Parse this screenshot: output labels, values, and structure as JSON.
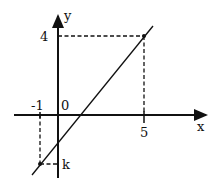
{
  "diagram": {
    "type": "coordinate-graph",
    "axes": {
      "x_label": "x",
      "y_label": "y",
      "origin_label": "0"
    },
    "ticks": {
      "x_neg": "-1",
      "x_pos": "5",
      "y_top": "4",
      "y_bottom": "k"
    },
    "points": [
      {
        "name": "A",
        "x": 5,
        "y": 4
      },
      {
        "name": "B",
        "x": -1,
        "y": "k"
      }
    ],
    "line": {
      "description": "straight line through (-1, k) and (5, 4)"
    },
    "colors": {
      "stroke": "#111111",
      "background": "#ffffff"
    }
  }
}
